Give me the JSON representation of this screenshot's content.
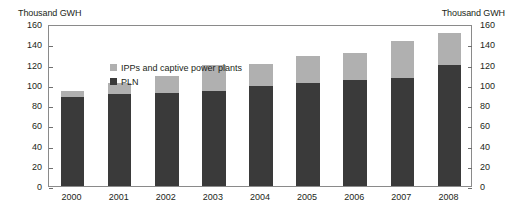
{
  "axis_titles": {
    "left": "Thousand GWH",
    "right": "Thousand GWH"
  },
  "legend": {
    "items": [
      {
        "label": "IPPs and captive power plants",
        "color": "#b0b0b0",
        "key": "ipp"
      },
      {
        "label": "PLN",
        "color": "#3a3a3a",
        "key": "pln"
      }
    ]
  },
  "chart_data": {
    "type": "bar",
    "stacked": true,
    "title": "",
    "subtitle": "",
    "xlabel": "",
    "ylabel": "Thousand GWH",
    "y2label": "Thousand GWH",
    "ylim": [
      0,
      160
    ],
    "y2lim": [
      0,
      160
    ],
    "ytick_step": 20,
    "grid": false,
    "legend_position": "inside-top-left",
    "categories": [
      "2000",
      "2001",
      "2002",
      "2003",
      "2004",
      "2005",
      "2006",
      "2007",
      "2008"
    ],
    "ytick_labels": [
      "160",
      "140",
      "120",
      "100",
      "80",
      "60",
      "40",
      "20",
      "0"
    ],
    "y2tick_labels": [
      "160",
      "140",
      "120",
      "100",
      "80",
      "60",
      "40",
      "20",
      "0"
    ],
    "series": [
      {
        "name": "PLN",
        "color": "#3a3a3a",
        "values": [
          88,
          91,
          92,
          94,
          99,
          102,
          105,
          107,
          120
        ]
      },
      {
        "name": "IPPs and captive power plants",
        "color": "#b0b0b0",
        "values": [
          6,
          11,
          17,
          26,
          22,
          26,
          26,
          36,
          31
        ]
      }
    ],
    "totals": [
      94,
      102,
      109,
      120,
      121,
      128,
      131,
      143,
      151
    ]
  }
}
